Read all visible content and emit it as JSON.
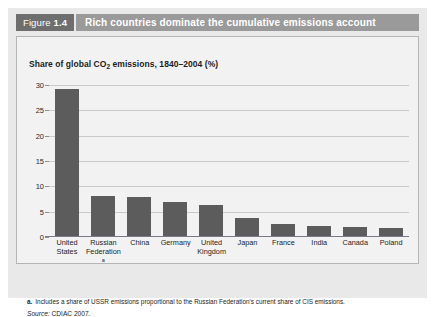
{
  "figure": {
    "label_word": "Figure",
    "number": "1.4",
    "title": "Rich countries dominate the cumulative emissions account"
  },
  "chart_data": {
    "type": "bar",
    "title": "Share of global CO2 emissions, 1840–2004 (%)",
    "subtitle_prefix": "Share of global CO",
    "subtitle_sub": "2",
    "subtitle_suffix": " emissions, 1840–2004 (%)",
    "xlabel": "",
    "ylabel": "",
    "ylim": [
      0,
      30
    ],
    "ytick_values": [
      0,
      5,
      10,
      15,
      20,
      25,
      30
    ],
    "ytick_labels": [
      "0",
      "5",
      "10",
      "15",
      "20",
      "25",
      "30"
    ],
    "grid": true,
    "legend": "none",
    "bar_color": "#5c5c5c",
    "categories": [
      "United States",
      "Russian Federation",
      "China",
      "Germany",
      "United Kingdom",
      "Japan",
      "France",
      "India",
      "Canada",
      "Poland"
    ],
    "category_lines": [
      [
        "United",
        "States"
      ],
      [
        "Russian",
        "Federation"
      ],
      [
        "China",
        ""
      ],
      [
        "Germany",
        ""
      ],
      [
        "United",
        "Kingdom"
      ],
      [
        "Japan",
        ""
      ],
      [
        "France",
        ""
      ],
      [
        "India",
        ""
      ],
      [
        "Canada",
        ""
      ],
      [
        "Poland",
        ""
      ]
    ],
    "category_footnote_marks": [
      "",
      "a",
      "",
      "",
      "",
      "",
      "",
      "",
      "",
      ""
    ],
    "values": [
      29.3,
      8.1,
      7.9,
      6.9,
      6.3,
      3.7,
      2.6,
      2.2,
      2.0,
      1.8
    ]
  },
  "notes": {
    "footnote_marker": "a.",
    "footnote_text": "Includes a share of USSR emissions proportional to the Russian Federation's current share of CIS emissions.",
    "source_word": "Source:",
    "source_text": "CDIAC 2007."
  },
  "colors": {
    "tab_gray": "#6e6e6e",
    "title_bar_gray": "#9a9a9a",
    "panel_gray": "#e9e9e9",
    "bar_gray": "#5c5c5c",
    "axis": "#7a7a8c"
  }
}
